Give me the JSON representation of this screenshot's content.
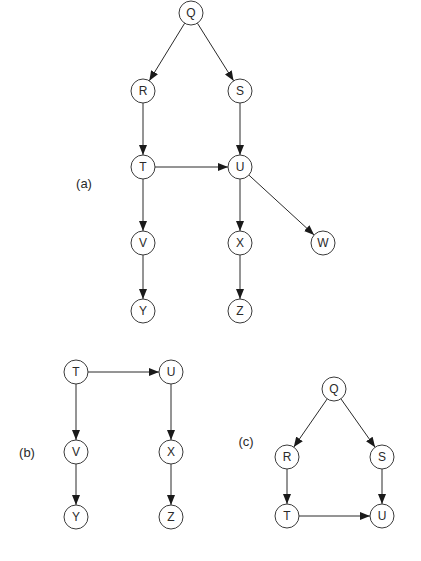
{
  "node_radius": 12,
  "colors": {
    "stroke": "#3a3a3a",
    "fill": "#ffffff",
    "text": "#2a2a2a"
  },
  "panels": [
    {
      "label": "(a)",
      "label_pos": [
        84,
        183
      ],
      "nodes": [
        {
          "id": "Q",
          "x": 191,
          "y": 13
        },
        {
          "id": "R",
          "x": 143,
          "y": 91
        },
        {
          "id": "S",
          "x": 240,
          "y": 91
        },
        {
          "id": "T",
          "x": 143,
          "y": 167
        },
        {
          "id": "U",
          "x": 240,
          "y": 167
        },
        {
          "id": "V",
          "x": 143,
          "y": 243
        },
        {
          "id": "X",
          "x": 240,
          "y": 243
        },
        {
          "id": "W",
          "x": 323,
          "y": 243
        },
        {
          "id": "Y",
          "x": 143,
          "y": 311
        },
        {
          "id": "Z",
          "x": 240,
          "y": 311
        }
      ],
      "edges": [
        [
          "Q",
          "R"
        ],
        [
          "Q",
          "S"
        ],
        [
          "R",
          "T"
        ],
        [
          "S",
          "U"
        ],
        [
          "T",
          "U"
        ],
        [
          "T",
          "V"
        ],
        [
          "U",
          "X"
        ],
        [
          "U",
          "W"
        ],
        [
          "V",
          "Y"
        ],
        [
          "X",
          "Z"
        ]
      ]
    },
    {
      "label": "(b)",
      "label_pos": [
        27,
        452
      ],
      "nodes": [
        {
          "id": "T",
          "x": 76,
          "y": 372
        },
        {
          "id": "U",
          "x": 171,
          "y": 372
        },
        {
          "id": "V",
          "x": 76,
          "y": 452
        },
        {
          "id": "X",
          "x": 171,
          "y": 452
        },
        {
          "id": "Y",
          "x": 76,
          "y": 517
        },
        {
          "id": "Z",
          "x": 171,
          "y": 517
        }
      ],
      "edges": [
        [
          "T",
          "U"
        ],
        [
          "T",
          "V"
        ],
        [
          "U",
          "X"
        ],
        [
          "V",
          "Y"
        ],
        [
          "X",
          "Z"
        ]
      ]
    },
    {
      "label": "(c)",
      "label_pos": [
        246,
        441
      ],
      "nodes": [
        {
          "id": "Q",
          "x": 334,
          "y": 389
        },
        {
          "id": "R",
          "x": 287,
          "y": 457
        },
        {
          "id": "S",
          "x": 382,
          "y": 457
        },
        {
          "id": "T",
          "x": 287,
          "y": 516
        },
        {
          "id": "U",
          "x": 382,
          "y": 516
        }
      ],
      "edges": [
        [
          "Q",
          "R"
        ],
        [
          "Q",
          "S"
        ],
        [
          "R",
          "T"
        ],
        [
          "S",
          "U"
        ],
        [
          "T",
          "U"
        ]
      ]
    }
  ]
}
